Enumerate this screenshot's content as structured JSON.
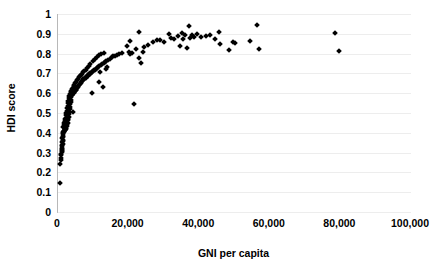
{
  "chart_data": {
    "type": "scatter",
    "title": "",
    "xlabel": "GNI per capita",
    "ylabel": "HDI score",
    "xlim": [
      0,
      100000
    ],
    "ylim": [
      0,
      1
    ],
    "grid": true,
    "legend": null,
    "marker": "diamond",
    "marker_color": "#000000",
    "xticks": [
      0,
      20000,
      40000,
      60000,
      80000,
      100000
    ],
    "xticklabels": [
      "0",
      "20,000",
      "40,000",
      "60,000",
      "80,000",
      "100,000"
    ],
    "yticks": [
      0,
      0.1,
      0.2,
      0.3,
      0.4,
      0.5,
      0.6,
      0.7,
      0.8,
      0.9,
      1
    ],
    "yticklabels": [
      "0",
      "0.1",
      "0.2",
      "0.3",
      "0.4",
      "0.5",
      "0.6",
      "0.7",
      "0.8",
      "0.9",
      "1"
    ],
    "points": [
      [
        600,
        0.145
      ],
      [
        700,
        0.243
      ],
      [
        800,
        0.262
      ],
      [
        850,
        0.275
      ],
      [
        900,
        0.286
      ],
      [
        950,
        0.294
      ],
      [
        1000,
        0.301
      ],
      [
        1050,
        0.308
      ],
      [
        1100,
        0.312
      ],
      [
        1150,
        0.318
      ],
      [
        1200,
        0.322
      ],
      [
        1000,
        0.332
      ],
      [
        1250,
        0.338
      ],
      [
        1300,
        0.344
      ],
      [
        1100,
        0.352
      ],
      [
        1350,
        0.358
      ],
      [
        1400,
        0.364
      ],
      [
        1200,
        0.372
      ],
      [
        1450,
        0.378
      ],
      [
        1500,
        0.384
      ],
      [
        1300,
        0.392
      ],
      [
        1550,
        0.398
      ],
      [
        1600,
        0.402
      ],
      [
        1400,
        0.406
      ],
      [
        1700,
        0.408
      ],
      [
        1800,
        0.41
      ],
      [
        1900,
        0.412
      ],
      [
        2000,
        0.414
      ],
      [
        2100,
        0.418
      ],
      [
        2200,
        0.421
      ],
      [
        2300,
        0.424
      ],
      [
        1500,
        0.427
      ],
      [
        1600,
        0.43
      ],
      [
        2400,
        0.433
      ],
      [
        2500,
        0.436
      ],
      [
        1700,
        0.44
      ],
      [
        2600,
        0.443
      ],
      [
        1800,
        0.447
      ],
      [
        2700,
        0.451
      ],
      [
        1900,
        0.455
      ],
      [
        2000,
        0.459
      ],
      [
        2800,
        0.463
      ],
      [
        2100,
        0.468
      ],
      [
        2900,
        0.472
      ],
      [
        2200,
        0.477
      ],
      [
        3000,
        0.482
      ],
      [
        2300,
        0.488
      ],
      [
        3100,
        0.493
      ],
      [
        2400,
        0.499
      ],
      [
        3200,
        0.505
      ],
      [
        4300,
        0.506
      ],
      [
        2500,
        0.512
      ],
      [
        3300,
        0.518
      ],
      [
        2600,
        0.524
      ],
      [
        3400,
        0.53
      ],
      [
        2700,
        0.537
      ],
      [
        3500,
        0.543
      ],
      [
        21500,
        0.545
      ],
      [
        2800,
        0.55
      ],
      [
        3600,
        0.556
      ],
      [
        2900,
        0.562
      ],
      [
        3700,
        0.568
      ],
      [
        3000,
        0.574
      ],
      [
        3800,
        0.579
      ],
      [
        3200,
        0.584
      ],
      [
        3900,
        0.589
      ],
      [
        4000,
        0.593
      ],
      [
        3400,
        0.596
      ],
      [
        4200,
        0.599
      ],
      [
        9500,
        0.6
      ],
      [
        4400,
        0.602
      ],
      [
        3600,
        0.604
      ],
      [
        4600,
        0.607
      ],
      [
        4800,
        0.609
      ],
      [
        3800,
        0.612
      ],
      [
        5000,
        0.615
      ],
      [
        5200,
        0.618
      ],
      [
        4000,
        0.621
      ],
      [
        5400,
        0.624
      ],
      [
        4200,
        0.627
      ],
      [
        5600,
        0.63
      ],
      [
        12800,
        0.632
      ],
      [
        5800,
        0.634
      ],
      [
        4400,
        0.637
      ],
      [
        6000,
        0.64
      ],
      [
        4600,
        0.643
      ],
      [
        6200,
        0.646
      ],
      [
        6400,
        0.649
      ],
      [
        4800,
        0.652
      ],
      [
        6600,
        0.655
      ],
      [
        11500,
        0.657
      ],
      [
        5000,
        0.659
      ],
      [
        6800,
        0.662
      ],
      [
        7000,
        0.665
      ],
      [
        5300,
        0.667
      ],
      [
        7200,
        0.67
      ],
      [
        7400,
        0.672
      ],
      [
        5600,
        0.674
      ],
      [
        7600,
        0.676
      ],
      [
        7800,
        0.679
      ],
      [
        5900,
        0.681
      ],
      [
        8000,
        0.683
      ],
      [
        8200,
        0.685
      ],
      [
        6200,
        0.687
      ],
      [
        8400,
        0.689
      ],
      [
        8600,
        0.691
      ],
      [
        6500,
        0.693
      ],
      [
        8800,
        0.695
      ],
      [
        9000,
        0.697
      ],
      [
        6800,
        0.699
      ],
      [
        9200,
        0.701
      ],
      [
        9400,
        0.703
      ],
      [
        7100,
        0.705
      ],
      [
        9600,
        0.707
      ],
      [
        12000,
        0.709
      ],
      [
        9900,
        0.711
      ],
      [
        7400,
        0.713
      ],
      [
        10200,
        0.715
      ],
      [
        10500,
        0.717
      ],
      [
        7800,
        0.719
      ],
      [
        10800,
        0.721
      ],
      [
        13500,
        0.723
      ],
      [
        11100,
        0.726
      ],
      [
        8200,
        0.728
      ],
      [
        11400,
        0.731
      ],
      [
        14000,
        0.733
      ],
      [
        11700,
        0.736
      ],
      [
        8700,
        0.739
      ],
      [
        12100,
        0.742
      ],
      [
        12500,
        0.746
      ],
      [
        9200,
        0.749
      ],
      [
        12900,
        0.752
      ],
      [
        23500,
        0.754
      ],
      [
        13300,
        0.757
      ],
      [
        9800,
        0.761
      ],
      [
        13700,
        0.764
      ],
      [
        14200,
        0.768
      ],
      [
        10400,
        0.771
      ],
      [
        14700,
        0.774
      ],
      [
        23000,
        0.777
      ],
      [
        15200,
        0.781
      ],
      [
        11000,
        0.784
      ],
      [
        15700,
        0.787
      ],
      [
        16200,
        0.79
      ],
      [
        11600,
        0.792
      ],
      [
        16800,
        0.794
      ],
      [
        20500,
        0.796
      ],
      [
        17400,
        0.798
      ],
      [
        12200,
        0.8
      ],
      [
        18000,
        0.801
      ],
      [
        21000,
        0.803
      ],
      [
        13000,
        0.805
      ],
      [
        24000,
        0.807
      ],
      [
        20000,
        0.81
      ],
      [
        79500,
        0.813
      ],
      [
        48500,
        0.816
      ],
      [
        57000,
        0.821
      ],
      [
        22000,
        0.824
      ],
      [
        36500,
        0.828
      ],
      [
        24500,
        0.832
      ],
      [
        34500,
        0.836
      ],
      [
        19500,
        0.84
      ],
      [
        25500,
        0.844
      ],
      [
        46000,
        0.848
      ],
      [
        50000,
        0.853
      ],
      [
        30000,
        0.857
      ],
      [
        27000,
        0.86
      ],
      [
        49500,
        0.861
      ],
      [
        54500,
        0.863
      ],
      [
        20500,
        0.866
      ],
      [
        28000,
        0.868
      ],
      [
        29000,
        0.87
      ],
      [
        33000,
        0.872
      ],
      [
        44500,
        0.874
      ],
      [
        35500,
        0.876
      ],
      [
        37500,
        0.878
      ],
      [
        32000,
        0.881
      ],
      [
        38500,
        0.884
      ],
      [
        40500,
        0.886
      ],
      [
        34000,
        0.888
      ],
      [
        42000,
        0.89
      ],
      [
        36000,
        0.892
      ],
      [
        43000,
        0.894
      ],
      [
        38000,
        0.896
      ],
      [
        31500,
        0.899
      ],
      [
        39500,
        0.901
      ],
      [
        78500,
        0.903
      ],
      [
        35000,
        0.905
      ],
      [
        45500,
        0.908
      ],
      [
        23000,
        0.91
      ],
      [
        37000,
        0.938
      ],
      [
        56500,
        0.943
      ]
    ]
  },
  "axes": {
    "y_title": "HDI score",
    "x_title": "GNI per capita"
  }
}
